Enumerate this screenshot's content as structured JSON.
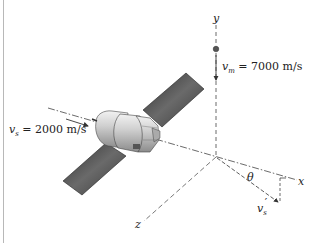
{
  "figure": {
    "axes": {
      "x_label": "x",
      "y_label": "y",
      "z_label": "z"
    },
    "meteoroid": {
      "symbol": "v",
      "subscript": "m",
      "equals": "= 7000 m/s"
    },
    "satellite_initial": {
      "symbol": "v",
      "subscript": "s",
      "equals": "= 2000 m/s"
    },
    "satellite_final": {
      "symbol": "v",
      "subscript": "s",
      "prime": "′"
    },
    "angle": {
      "symbol": "θ"
    },
    "colors": {
      "line": "#333333",
      "panel_dark": "#3a3a3a",
      "panel_light": "#8a8a8a",
      "body": "#c8c8c8",
      "border": "#b8b8b8"
    }
  }
}
